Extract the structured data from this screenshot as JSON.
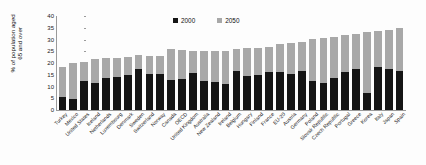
{
  "chart_data": {
    "type": "bar",
    "subtype": "stacked-bar",
    "title": "",
    "xlabel": "",
    "ylabel": "% of population aged 65 and over",
    "ylim": [
      0,
      40
    ],
    "yticks": [
      0,
      5,
      10,
      15,
      20,
      25,
      30,
      35,
      40
    ],
    "grid": false,
    "legend_position": "top-center",
    "categories": [
      "Turkey",
      "Mexico",
      "United States",
      "Iceland",
      "Netherlands",
      "Luxembourg",
      "Denmark",
      "Sweden",
      "Switzerland",
      "Norway",
      "Canada",
      "OECD",
      "United Kingdom",
      "Australia",
      "New Zealand",
      "Ireland",
      "Belgium",
      "Hungary",
      "Finland",
      "France",
      "EU-20",
      "Austria",
      "Germany",
      "Poland",
      "Slovak Republic",
      "Czech Republic",
      "Portugal",
      "Greece",
      "Korea",
      "Italy",
      "Japan",
      "Spain"
    ],
    "series": [
      {
        "name": "2000",
        "color": "#151515",
        "values": [
          5.5,
          4.9,
          12.4,
          11.6,
          13.6,
          14.2,
          14.8,
          17.3,
          15.4,
          15.2,
          12.6,
          13.0,
          15.8,
          12.3,
          11.8,
          11.2,
          16.8,
          14.6,
          14.9,
          16.0,
          16.3,
          15.5,
          16.4,
          12.2,
          11.4,
          13.8,
          16.2,
          17.3,
          7.2,
          18.1,
          17.4,
          16.8
        ]
      },
      {
        "name": "2050",
        "color": "#a8a8a8",
        "values": [
          18.5,
          20.0,
          20.6,
          21.7,
          22.3,
          22.2,
          22.6,
          23.6,
          23.1,
          23.0,
          26.0,
          25.6,
          25.2,
          25.0,
          25.1,
          25.3,
          26.0,
          26.2,
          26.6,
          26.8,
          28.2,
          28.5,
          29.0,
          30.3,
          30.5,
          31.0,
          31.8,
          32.4,
          33.0,
          33.6,
          34.0,
          35.0
        ]
      }
    ],
    "note": "Each bar is stacked: black segment = 2000 value; total bar height = 2050 value (gray is the 2050 increment above 2000)."
  },
  "legend": {
    "items": [
      {
        "label": "2000",
        "color": "#151515",
        "swatch": "legend-swatch-2000"
      },
      {
        "label": "2050",
        "color": "#a8a8a8",
        "swatch": "legend-swatch-2050"
      }
    ]
  },
  "axis": {
    "y_title": "% of population aged\n65 and over"
  },
  "colors": {
    "series_2000": "#151515",
    "series_2050": "#a8a8a8",
    "axis": "#9a9a9a",
    "text": "#1a1a1a",
    "background": "#fdfdfd"
  }
}
